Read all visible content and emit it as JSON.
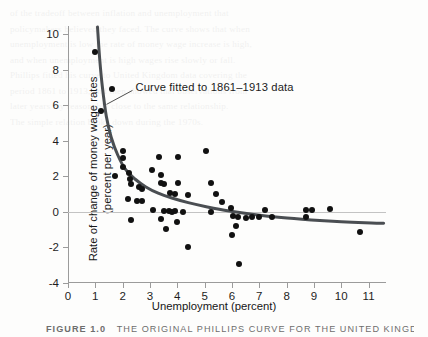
{
  "figure": {
    "caption_number": "FIGURE 1.0",
    "caption_title": "THE ORIGINAL PHILLIPS CURVE FOR THE UNITED KINGDOM",
    "annotation": "Curve fitted to 1861–1913 data",
    "bleed_text": "of the tradeoff between inflation and unemployment that\npolicymakers believed they faced. The curve shows that when\nunemployment is low the rate of money wage increase is high,\nand when unemployment is high wages rise slowly or fall.\nPhillips fitted his curve to United Kingdom data covering the\nperiod 1861 to 1913, and then showed that observations from\nlater years lay reasonably close to the same relationship.\nThe simple relation broke down during the 1970s."
  },
  "chart_data": {
    "type": "scatter",
    "title": "",
    "xlabel": "Unemployment (percent)",
    "ylabel": "Rate of change of money wage rates (percent per year)",
    "ylabel_line1": "Rate of change of money wage rates",
    "ylabel_line2": "(percent per year)",
    "xlim": [
      0,
      11.6
    ],
    "ylim": [
      -4,
      10.4
    ],
    "xticks": [
      0,
      1,
      2,
      3,
      4,
      5,
      6,
      7,
      8,
      9,
      10,
      11
    ],
    "xticklabels": [
      "0",
      "1",
      "2",
      "3",
      "4",
      "5",
      "6",
      "7",
      "8",
      "9",
      "10",
      "11"
    ],
    "yticks": [
      -4,
      -2,
      0,
      2,
      4,
      6,
      8,
      10
    ],
    "yticklabels": [
      "-4",
      "-2",
      "0",
      "2",
      "4",
      "6",
      "8",
      "10"
    ],
    "grid": false,
    "legend": "none",
    "zero_line_y": 0,
    "marker_color": "#111111",
    "curve_color": "#4a4e52",
    "axis_color": "#9b9b9b",
    "zero_line_color": "#c3c3c3",
    "points": [
      [
        1.0,
        9.0
      ],
      [
        1.62,
        6.9
      ],
      [
        1.22,
        5.7
      ],
      [
        2.02,
        3.45
      ],
      [
        2.0,
        3.05
      ],
      [
        2.02,
        2.55
      ],
      [
        3.32,
        3.1
      ],
      [
        4.02,
        3.1
      ],
      [
        5.05,
        3.4
      ],
      [
        1.72,
        2.0
      ],
      [
        2.22,
        2.2
      ],
      [
        2.28,
        1.85
      ],
      [
        2.32,
        1.55
      ],
      [
        2.6,
        1.4
      ],
      [
        2.7,
        1.3
      ],
      [
        2.18,
        0.7
      ],
      [
        2.52,
        0.6
      ],
      [
        2.7,
        0.62
      ],
      [
        3.08,
        2.35
      ],
      [
        3.42,
        2.05
      ],
      [
        3.4,
        1.6
      ],
      [
        3.5,
        1.55
      ],
      [
        4.02,
        1.6
      ],
      [
        3.72,
        1.05
      ],
      [
        3.92,
        1.0
      ],
      [
        4.4,
        0.95
      ],
      [
        3.1,
        0.1
      ],
      [
        3.52,
        0.05
      ],
      [
        3.68,
        0.05
      ],
      [
        3.8,
        0.02
      ],
      [
        3.92,
        0.05
      ],
      [
        4.2,
        0.02
      ],
      [
        5.22,
        1.6
      ],
      [
        5.4,
        1.0
      ],
      [
        5.62,
        0.55
      ],
      [
        5.95,
        0.2
      ],
      [
        6.05,
        -0.25
      ],
      [
        6.22,
        -0.28
      ],
      [
        6.52,
        -0.32
      ],
      [
        6.72,
        -0.3
      ],
      [
        7.0,
        -0.28
      ],
      [
        7.22,
        0.08
      ],
      [
        7.48,
        -0.3
      ],
      [
        8.7,
        0.12
      ],
      [
        8.92,
        0.12
      ],
      [
        8.72,
        -0.3
      ],
      [
        9.6,
        0.18
      ],
      [
        10.7,
        -1.15
      ],
      [
        2.3,
        -0.45
      ],
      [
        3.42,
        -0.42
      ],
      [
        4.0,
        -0.55
      ],
      [
        3.58,
        -0.95
      ],
      [
        4.38,
        -1.95
      ],
      [
        6.15,
        -0.8
      ],
      [
        6.0,
        -1.3
      ],
      [
        6.25,
        -2.95
      ],
      [
        5.22,
        -0.02
      ]
    ],
    "fit_curve": {
      "description": "Phillips curve fitted to 1861-1913 data",
      "path": [
        [
          1.08,
          10.4
        ],
        [
          1.16,
          8.6
        ],
        [
          1.26,
          7.0
        ],
        [
          1.4,
          5.4
        ],
        [
          1.58,
          4.2
        ],
        [
          1.82,
          3.2
        ],
        [
          2.1,
          2.4
        ],
        [
          2.45,
          1.85
        ],
        [
          2.85,
          1.4
        ],
        [
          3.3,
          1.05
        ],
        [
          3.8,
          0.78
        ],
        [
          4.4,
          0.52
        ],
        [
          5.1,
          0.28
        ],
        [
          5.9,
          0.05
        ],
        [
          6.8,
          -0.15
        ],
        [
          7.8,
          -0.32
        ],
        [
          8.9,
          -0.45
        ],
        [
          10.0,
          -0.55
        ],
        [
          11.1,
          -0.62
        ],
        [
          11.55,
          -0.64
        ]
      ]
    },
    "annotation_text": "Curve fitted to 1861–1913 data",
    "annotation_point": [
      1.3,
      6.55
    ]
  }
}
